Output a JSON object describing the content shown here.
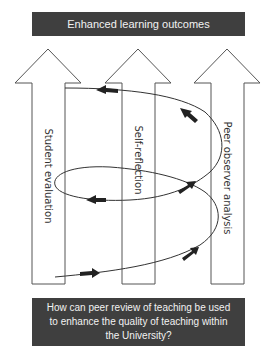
{
  "title_box": {
    "text": "Enhanced learning outcomes"
  },
  "question_box": {
    "lines": [
      "How can peer review of teaching be used",
      "to enhance the quality of teaching within",
      "the University?"
    ]
  },
  "arrows": [
    {
      "label": "Student evaluation",
      "cx": 48
    },
    {
      "label": "Self-reflection",
      "cx": 138
    },
    {
      "label": "Peer observer analysis",
      "cx": 227
    }
  ],
  "colors": {
    "box_fill": "#3f3f3f",
    "box_text": "#f2f2f2",
    "line": "#333333",
    "arrow_outline": "#555555"
  }
}
